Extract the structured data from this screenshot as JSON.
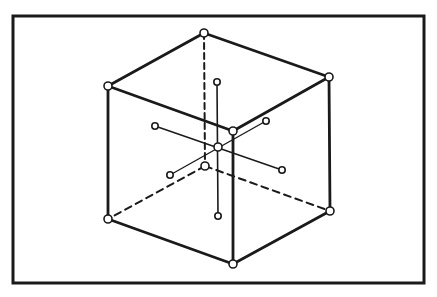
{
  "diagram": {
    "title": "",
    "colors": {
      "stroke": "#1a1a1a",
      "background": "#ffffff",
      "node_fill": "#ffffff"
    },
    "frame": {
      "x": 13,
      "y": 16,
      "w": 411,
      "h": 267
    },
    "vertices": {
      "top_back": [
        204,
        33
      ],
      "top_right": [
        329,
        77
      ],
      "top_left": [
        108,
        86
      ],
      "top_front": [
        233,
        131
      ],
      "bottom_back": [
        205,
        166
      ],
      "bottom_left": [
        108,
        219
      ],
      "bottom_right": [
        330,
        211
      ],
      "bottom_front": [
        233,
        264
      ]
    },
    "center": [
      218,
      147
    ],
    "axis_endpoints": {
      "vertical_top": [
        217,
        82
      ],
      "vertical_bottom": [
        218,
        216
      ],
      "diag1_a": [
        155,
        126
      ],
      "diag1_b": [
        282,
        170
      ],
      "diag2_a": [
        170,
        175
      ],
      "diag2_b": [
        266,
        121
      ]
    }
  }
}
